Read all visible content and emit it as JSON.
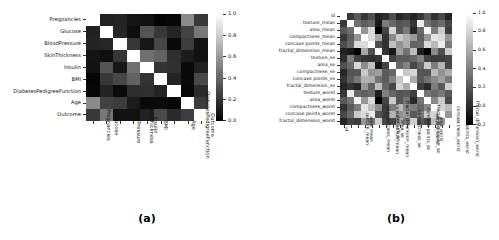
{
  "figure": {
    "background": "#ffffff",
    "panels": [
      {
        "id": "a",
        "caption": "(a)",
        "chart_data": {
          "type": "heatmap",
          "title": "",
          "xlabel": "",
          "ylabel": "",
          "colormap": "gray",
          "grid": false,
          "legend_position": "right",
          "colorbar": {
            "vmin": 0.0,
            "vmax": 1.0,
            "ticks": [
              1.0,
              0.8,
              0.6,
              0.4,
              0.2,
              0.0
            ],
            "tick_labels": [
              "1.0",
              "0.8",
              "0.6",
              "0.4",
              "0.2",
              "0.0"
            ]
          },
          "categories": [
            "Pregnancies",
            "Glucose",
            "BloodPressure",
            "SkinThickness",
            "Insulin",
            "BMI",
            "DiabetesPedigreeFunction",
            "Age",
            "Outcome"
          ],
          "x_tick_labels": [
            "Pregnancies",
            "Glucose",
            "BloodPressure",
            "SkinThickness",
            "Insulin",
            "BMI",
            "DiabetesPedigreeFunction",
            "Age",
            "Outcome"
          ],
          "y_tick_labels": [
            "Pregnancies",
            "Glucose",
            "BloodPressure",
            "SkinThickness",
            "Insulin",
            "BMI",
            "DiabetesPedigreeFunction",
            "Age",
            "Outcome"
          ],
          "values": [
            [
              1.0,
              0.13,
              0.14,
              0.08,
              0.07,
              0.02,
              0.03,
              0.54,
              0.22
            ],
            [
              0.13,
              1.0,
              0.15,
              0.06,
              0.33,
              0.22,
              0.14,
              0.26,
              0.47
            ],
            [
              0.14,
              0.15,
              1.0,
              0.21,
              0.09,
              0.28,
              0.04,
              0.24,
              0.07
            ],
            [
              0.08,
              0.06,
              0.21,
              1.0,
              0.44,
              0.39,
              0.18,
              0.11,
              0.07
            ],
            [
              0.07,
              0.33,
              0.09,
              0.44,
              1.0,
              0.2,
              0.19,
              0.04,
              0.13
            ],
            [
              0.02,
              0.22,
              0.28,
              0.39,
              0.2,
              1.0,
              0.14,
              0.04,
              0.29
            ],
            [
              0.03,
              0.14,
              0.04,
              0.18,
              0.19,
              0.14,
              1.0,
              0.03,
              0.17
            ],
            [
              0.54,
              0.26,
              0.24,
              0.11,
              0.04,
              0.04,
              0.03,
              1.0,
              0.24
            ],
            [
              0.22,
              0.47,
              0.07,
              0.07,
              0.13,
              0.29,
              0.17,
              0.24,
              1.0
            ]
          ]
        }
      },
      {
        "id": "b",
        "caption": "(b)",
        "chart_data": {
          "type": "heatmap",
          "title": "",
          "xlabel": "",
          "ylabel": "",
          "colormap": "gray",
          "grid": false,
          "legend_position": "right",
          "colorbar": {
            "vmin": -0.2,
            "vmax": 1.0,
            "ticks": [
              1.0,
              0.8,
              0.6,
              0.4,
              0.2,
              0.0,
              -0.2
            ],
            "tick_labels": [
              "1.0",
              "0.8",
              "0.6",
              "0.4",
              "0.2",
              "0.0",
              "0.2"
            ]
          },
          "categories": [
            "id",
            "texture_mean",
            "area_mean",
            "compactness_mean",
            "concave points_mean",
            "fractal_dimension_mean",
            "texture_se",
            "area_se",
            "compactness_se",
            "concave points_se",
            "fractal_dimension_se",
            "texture_worst",
            "area_worst",
            "compactness_worst",
            "concave points_worst",
            "fractal_dimension_worst"
          ],
          "x_tick_labels": [
            "id",
            "texture_mean",
            "area_mean",
            "compactness_mean",
            "concave points_mean",
            "fractal_dimension_mean",
            "texture_se",
            "area_se",
            "compactness_se",
            "concave points_se",
            "fractal_dimension_se",
            "texture_worst",
            "area_worst",
            "compactness_worst",
            "concave points_worst",
            "fractal_dimension_worst"
          ],
          "y_tick_labels": [
            "id",
            "texture_mean",
            "area_mean",
            "compactness_mean",
            "concave points_mean",
            "fractal_dimension_mean",
            "texture_se",
            "area_se",
            "compactness_se",
            "concave points_se",
            "fractal_dimension_se",
            "texture_worst",
            "area_worst",
            "compactness_worst",
            "concave points_worst",
            "fractal_dimension_worst"
          ],
          "values": [
            [
              1.0,
              0.07,
              0.22,
              0.06,
              0.17,
              -0.04,
              0.01,
              0.17,
              -0.02,
              0.04,
              -0.03,
              0.06,
              0.22,
              0.04,
              0.14,
              -0.03
            ],
            [
              0.07,
              1.0,
              0.32,
              0.24,
              0.29,
              -0.08,
              0.39,
              0.29,
              0.19,
              0.23,
              0.05,
              0.91,
              0.34,
              0.23,
              0.3,
              0.12
            ],
            [
              0.22,
              0.32,
              1.0,
              0.5,
              0.82,
              -0.28,
              0.11,
              0.8,
              0.21,
              0.37,
              -0.02,
              0.29,
              0.96,
              0.39,
              0.75,
              0.08
            ],
            [
              0.06,
              0.24,
              0.5,
              1.0,
              0.83,
              0.58,
              0.05,
              0.45,
              0.74,
              0.63,
              0.51,
              0.25,
              0.51,
              0.87,
              0.82,
              0.51
            ],
            [
              0.17,
              0.29,
              0.82,
              0.83,
              1.0,
              0.17,
              0.03,
              0.7,
              0.49,
              0.62,
              0.26,
              0.29,
              0.82,
              0.67,
              0.91,
              0.37
            ],
            [
              -0.04,
              -0.08,
              -0.28,
              0.58,
              0.17,
              1.0,
              0.05,
              -0.09,
              0.55,
              0.34,
              0.69,
              -0.05,
              -0.23,
              0.46,
              0.18,
              0.77
            ],
            [
              0.01,
              0.39,
              0.11,
              0.05,
              0.03,
              0.05,
              1.0,
              0.11,
              0.23,
              0.23,
              0.28,
              0.41,
              0.12,
              0.08,
              0.08,
              0.13
            ],
            [
              0.17,
              0.29,
              0.8,
              0.45,
              0.7,
              -0.09,
              0.11,
              1.0,
              0.29,
              0.42,
              0.13,
              0.28,
              0.75,
              0.39,
              0.64,
              0.13
            ],
            [
              -0.02,
              0.19,
              0.21,
              0.74,
              0.49,
              0.55,
              0.23,
              0.29,
              1.0,
              0.74,
              0.8,
              0.2,
              0.2,
              0.68,
              0.48,
              0.61
            ],
            [
              0.04,
              0.23,
              0.37,
              0.63,
              0.62,
              0.34,
              0.23,
              0.42,
              0.74,
              1.0,
              0.61,
              0.22,
              0.34,
              0.45,
              0.55,
              0.37
            ],
            [
              -0.03,
              0.05,
              -0.02,
              0.51,
              0.26,
              0.69,
              0.28,
              0.13,
              0.8,
              0.61,
              1.0,
              0.1,
              0.0,
              0.39,
              0.22,
              0.77
            ],
            [
              0.06,
              0.91,
              0.29,
              0.25,
              0.29,
              -0.05,
              0.41,
              0.28,
              0.2,
              0.22,
              0.1,
              1.0,
              0.35,
              0.28,
              0.36,
              0.22
            ],
            [
              0.22,
              0.34,
              0.96,
              0.51,
              0.82,
              -0.23,
              0.12,
              0.75,
              0.2,
              0.34,
              0.0,
              0.35,
              1.0,
              0.44,
              0.75,
              0.14
            ],
            [
              0.04,
              0.23,
              0.39,
              0.87,
              0.67,
              0.46,
              0.08,
              0.39,
              0.68,
              0.45,
              0.39,
              0.28,
              0.44,
              1.0,
              0.8,
              0.69
            ],
            [
              0.14,
              0.3,
              0.75,
              0.82,
              0.91,
              0.18,
              0.08,
              0.64,
              0.48,
              0.55,
              0.22,
              0.36,
              0.75,
              0.8,
              1.0,
              0.51
            ],
            [
              -0.03,
              0.12,
              0.08,
              0.51,
              0.37,
              0.77,
              0.13,
              0.13,
              0.61,
              0.37,
              0.77,
              0.22,
              0.14,
              0.69,
              0.51,
              1.0
            ]
          ]
        }
      }
    ]
  }
}
